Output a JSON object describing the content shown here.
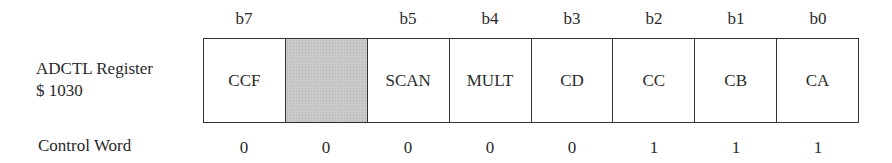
{
  "register": {
    "name": "ADCTL Register",
    "address": "$ 1030",
    "bits": [
      {
        "label": "b7",
        "name": "CCF",
        "value": "0",
        "shaded": false
      },
      {
        "label": "",
        "name": "",
        "value": "0",
        "shaded": true
      },
      {
        "label": "b5",
        "name": "SCAN",
        "value": "0",
        "shaded": false
      },
      {
        "label": "b4",
        "name": "MULT",
        "value": "0",
        "shaded": false
      },
      {
        "label": "b3",
        "name": "CD",
        "value": "0",
        "shaded": false
      },
      {
        "label": "b2",
        "name": "CC",
        "value": "1",
        "shaded": false
      },
      {
        "label": "b1",
        "name": "CB",
        "value": "1",
        "shaded": false
      },
      {
        "label": "b0",
        "name": "CA",
        "value": "1",
        "shaded": false
      }
    ]
  },
  "control_word_label": "Control Word",
  "colors": {
    "border": "#333333",
    "shaded": "#c9c9c9",
    "text": "#2a2a2a"
  }
}
